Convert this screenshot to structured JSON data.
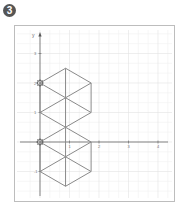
{
  "exercise": {
    "number": "3"
  },
  "chart_data": {
    "type": "diagram",
    "title": "",
    "xlabel": "",
    "ylabel": "y",
    "origin_px": [
      40,
      142
    ],
    "unit_px": 29.5,
    "xlim": [
      -0.65,
      4.35
    ],
    "ylim": [
      -1.85,
      3.7
    ],
    "grid": true,
    "minor_divisions": 3,
    "x_ticks": [
      1,
      2,
      3,
      4
    ],
    "y_ticks": [
      -1,
      1,
      2,
      3
    ],
    "x_tick_labels": [
      "1",
      "2",
      "3",
      "4"
    ],
    "y_tick_labels": [
      "-1",
      "1",
      "2",
      "3"
    ],
    "shapes": [
      {
        "name": "upper-hexagon",
        "type": "hexagon-divided-into-6-triangles",
        "center": [
          0.866,
          1.5
        ],
        "vertices": [
          [
            0.866,
            2.5
          ],
          [
            1.732,
            2
          ],
          [
            1.732,
            1
          ],
          [
            0.866,
            0.5
          ],
          [
            0,
            1
          ],
          [
            0,
            2
          ]
        ]
      },
      {
        "name": "lower-hexagon",
        "type": "hexagon-divided-into-6-triangles",
        "center": [
          0.866,
          -0.5
        ],
        "vertices": [
          [
            0.866,
            0.5
          ],
          [
            1.732,
            0
          ],
          [
            1.732,
            -1
          ],
          [
            0.866,
            -1.5
          ],
          [
            0,
            -1
          ],
          [
            0,
            0
          ]
        ]
      }
    ],
    "markers": [
      {
        "name": "rotation-center-marker",
        "point": [
          0,
          2
        ]
      },
      {
        "name": "rotation-center-marker",
        "point": [
          0,
          0
        ]
      }
    ],
    "colors": {
      "shape_stroke": "#8a8a8a",
      "axis": "#555555",
      "grid_major": "#e2e2e2",
      "grid_minor": "#f1f1f1",
      "frame": "#bdbdbd"
    }
  }
}
